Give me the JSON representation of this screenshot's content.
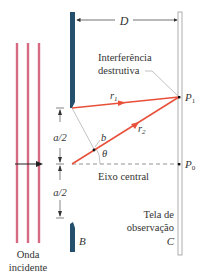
{
  "diagram": {
    "type": "double-slit interference geometry",
    "labels": {
      "distance": "D",
      "interference_line1": "Interferência",
      "interference_line2": "destrutiva",
      "ray1": "r",
      "ray1_sub": "1",
      "ray2": "r",
      "ray2_sub": "2",
      "point1": "P",
      "point1_sub": "1",
      "point0": "P",
      "point0_sub": "0",
      "half_spacing_top": "a/2",
      "half_spacing_bottom": "a/2",
      "point_b": "b",
      "angle": "θ",
      "central_axis": "Eixo central",
      "screen_line1": "Tela de",
      "screen_line2": "observação",
      "screen_letter": "C",
      "barrier_letter": "B",
      "wave_line1": "Onda",
      "wave_line2": "incidente"
    },
    "colors": {
      "wave": "#d66a82",
      "barrier": "#24506e",
      "ray": "#e8503a",
      "line": "#555555",
      "screen": "#999999"
    }
  }
}
